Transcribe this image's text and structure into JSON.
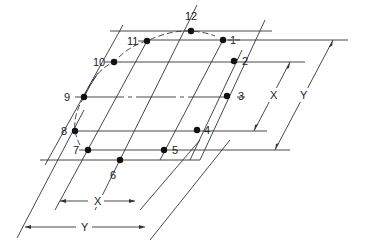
{
  "diagram": {
    "type": "oblique isometric circle plotting grid",
    "points": [
      {
        "id": "1",
        "label": "1",
        "x": 223,
        "y": 40,
        "lx": 230,
        "ly": 35
      },
      {
        "id": "2",
        "label": "2",
        "x": 234,
        "y": 61,
        "lx": 242,
        "ly": 56
      },
      {
        "id": "3",
        "label": "3",
        "x": 227,
        "y": 96,
        "lx": 238,
        "ly": 91
      },
      {
        "id": "4",
        "label": "4",
        "x": 197,
        "y": 130,
        "lx": 204,
        "ly": 125
      },
      {
        "id": "5",
        "label": "5",
        "x": 164,
        "y": 150,
        "lx": 172,
        "ly": 145
      },
      {
        "id": "6",
        "label": "6",
        "x": 120,
        "y": 160,
        "lx": 110,
        "ly": 170
      },
      {
        "id": "7",
        "label": "7",
        "x": 88,
        "y": 150,
        "lx": 73,
        "ly": 145
      },
      {
        "id": "8",
        "label": "8",
        "x": 75,
        "y": 131,
        "lx": 61,
        "ly": 126
      },
      {
        "id": "9",
        "label": "9",
        "x": 84,
        "y": 97,
        "lx": 64,
        "ly": 92
      },
      {
        "id": "10",
        "label": "10",
        "x": 114,
        "y": 62,
        "lx": 93,
        "ly": 57
      },
      {
        "id": "11",
        "label": "11",
        "x": 147,
        "y": 41,
        "lx": 127,
        "ly": 36
      },
      {
        "id": "12",
        "label": "12",
        "x": 191,
        "y": 31,
        "lx": 185,
        "ly": 11
      }
    ],
    "dimensions": {
      "right_x": {
        "label": "X",
        "lx": 270,
        "ly": 90
      },
      "right_y": {
        "label": "Y",
        "lx": 300,
        "ly": 90
      },
      "bottom_x": {
        "label": "X",
        "lx": 94,
        "ly": 196
      },
      "bottom_y": {
        "label": "Y",
        "lx": 81,
        "ly": 222
      }
    },
    "colors": {
      "line": "#333333",
      "point": "#111111",
      "background": "#ffffff"
    }
  }
}
